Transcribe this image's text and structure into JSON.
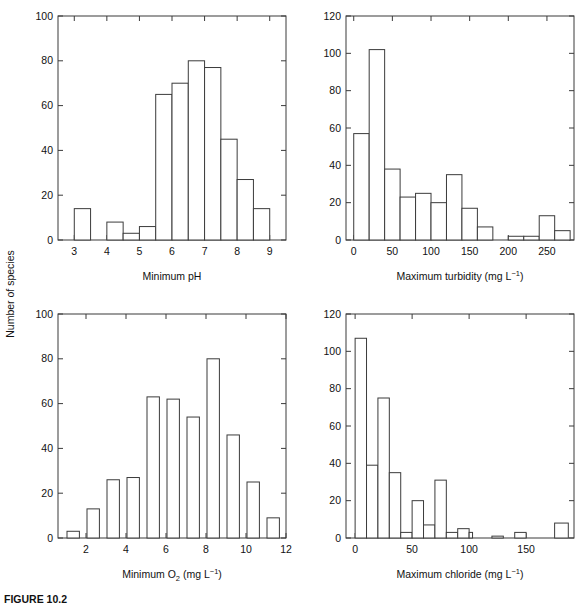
{
  "figure": {
    "caption": "FIGURE 10.2",
    "ylabel": "Number of species"
  },
  "chart_data": [
    {
      "id": "minimum-ph",
      "type": "bar",
      "title": "",
      "xlabel": "Minimum pH",
      "ylabel": "Number of species",
      "xlim": [
        2.5,
        9.5
      ],
      "ylim": [
        0,
        100
      ],
      "xticks": [
        3,
        4,
        5,
        6,
        7,
        8,
        9
      ],
      "yticks": [
        0,
        20,
        40,
        60,
        80,
        100
      ],
      "bin_width": 0.5,
      "bin_starts": [
        3.0,
        4.0,
        4.5,
        5.0,
        5.5,
        6.0,
        6.5,
        7.0,
        7.5,
        8.0,
        8.5
      ],
      "categories": [
        "3.0-3.5",
        "4.0-4.5",
        "4.5-5.0",
        "5.0-5.5",
        "5.5-6.0",
        "6.0-6.5",
        "6.5-7.0",
        "7.0-7.5",
        "7.5-8.0",
        "8.0-8.5",
        "8.5-9.0"
      ],
      "values": [
        14,
        8,
        3,
        6,
        65,
        70,
        80,
        77,
        45,
        27,
        14
      ],
      "grid": false
    },
    {
      "id": "maximum-turbidity",
      "type": "bar",
      "title": "",
      "xlabel": "Maximum turbidity (mg L-1)",
      "xlabel_base": "Maximum turbidity (mg L",
      "xlabel_sup": "−1",
      "xlabel_tail": ")",
      "ylabel": "Number of species",
      "xlim": [
        -10,
        285
      ],
      "ylim": [
        0,
        120
      ],
      "xticks": [
        0,
        50,
        100,
        150,
        200,
        250
      ],
      "yticks": [
        0,
        20,
        40,
        60,
        80,
        100,
        120
      ],
      "bin_width": 20,
      "bin_starts": [
        0,
        20,
        40,
        60,
        80,
        100,
        120,
        140,
        160,
        200,
        220,
        240,
        260
      ],
      "categories": [
        "0-20",
        "20-40",
        "40-60",
        "60-80",
        "80-100",
        "100-120",
        "120-140",
        "140-160",
        "160-180",
        "200-220",
        "220-240",
        "240-260",
        "260-280"
      ],
      "values": [
        57,
        102,
        38,
        23,
        25,
        20,
        35,
        17,
        7,
        2,
        2,
        13,
        5
      ],
      "grid": false
    },
    {
      "id": "minimum-o2",
      "type": "bar",
      "title": "",
      "xlabel": "Minimum O2 (mg L-1)",
      "xlabel_base": "Minimum O",
      "xlabel_sub": "2",
      "xlabel_mid": " (mg L",
      "xlabel_sup": "−1",
      "xlabel_tail": ")",
      "ylabel": "Number of species",
      "xlim": [
        0.6,
        12
      ],
      "ylim": [
        0,
        100
      ],
      "xticks": [
        2,
        4,
        6,
        8,
        10,
        12
      ],
      "yticks": [
        0,
        20,
        40,
        60,
        80,
        100
      ],
      "bin_width": 0.62,
      "bin_starts": [
        1.05,
        2.05,
        3.05,
        4.05,
        5.05,
        6.05,
        7.05,
        8.05,
        9.05,
        10.05,
        11.05
      ],
      "categories": [
        "1",
        "2",
        "3",
        "4",
        "5",
        "6",
        "7",
        "8",
        "9",
        "10",
        "11"
      ],
      "values": [
        3,
        13,
        26,
        27,
        63,
        62,
        54,
        80,
        46,
        25,
        9
      ],
      "grid": false
    },
    {
      "id": "maximum-chloride",
      "type": "bar",
      "title": "",
      "xlabel": "Maximum chloride (mg L-1)",
      "xlabel_base": "Maximum chloride (mg L",
      "xlabel_sup": "−1",
      "xlabel_tail": ")",
      "ylabel": "Number of species",
      "xlim": [
        -8,
        192
      ],
      "ylim": [
        0,
        120
      ],
      "xticks": [
        0,
        50,
        100,
        150
      ],
      "yticks": [
        0,
        20,
        40,
        60,
        80,
        100,
        120
      ],
      "bin_width": 10,
      "bin_starts": [
        0,
        10,
        20,
        30,
        40,
        50,
        60,
        70,
        80,
        90,
        120,
        140,
        175
      ],
      "categories": [
        "0-10",
        "10-20",
        "20-30",
        "30-40",
        "40-50",
        "50-60",
        "60-70",
        "70-80",
        "80-90",
        "90-100",
        "120-130",
        "140-150",
        "175-185"
      ],
      "values": [
        107,
        39,
        75,
        35,
        3,
        20,
        7,
        31,
        3,
        5,
        1,
        3,
        8
      ],
      "bar_widths": [
        10,
        10,
        10,
        10,
        10,
        10,
        10,
        10,
        10,
        10,
        10,
        10,
        12
      ],
      "extra_zero_bar": {
        "start": 100,
        "width": 3,
        "value": 3
      },
      "grid": false
    }
  ]
}
